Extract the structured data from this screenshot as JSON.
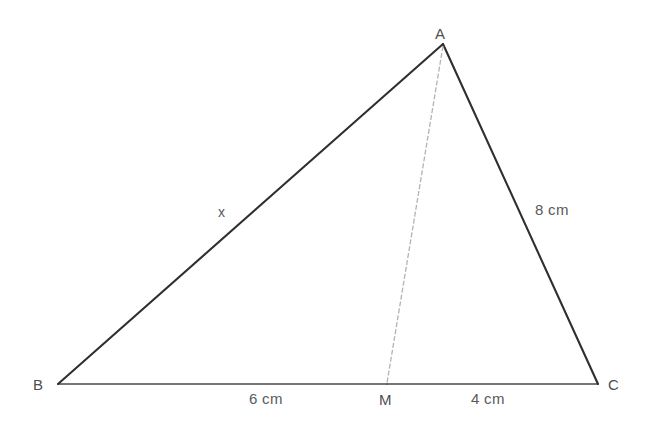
{
  "figure": {
    "kind": "geometry-triangle-with-cevian",
    "background_color": "#ffffff",
    "width": 645,
    "height": 425,
    "stroke_colors": {
      "side_dark": "#2f2f2f",
      "base": "#4a4a4a",
      "cevian": "#b0b0b0",
      "label": "#555555"
    },
    "vertices": {
      "A": {
        "label": "A",
        "x": 443,
        "y": 44
      },
      "B": {
        "label": "B",
        "x": 58,
        "y": 384
      },
      "C": {
        "label": "C",
        "x": 598,
        "y": 384
      },
      "M": {
        "label": "M",
        "x": 387,
        "y": 384
      }
    },
    "segments": [
      {
        "name": "AB",
        "from": "B",
        "to": "A",
        "style": "solid",
        "label": "x"
      },
      {
        "name": "AC",
        "from": "A",
        "to": "C",
        "style": "solid",
        "label": "8 cm"
      },
      {
        "name": "BC",
        "from": "B",
        "to": "C",
        "style": "solid",
        "label": ""
      },
      {
        "name": "BM",
        "from": "B",
        "to": "M",
        "style": "solid",
        "label": "6 cm"
      },
      {
        "name": "MC",
        "from": "M",
        "to": "C",
        "style": "solid",
        "label": "4 cm"
      },
      {
        "name": "AM",
        "from": "A",
        "to": "M",
        "style": "dashed",
        "label": ""
      }
    ],
    "labels": {
      "vertex_a": "A",
      "vertex_b": "B",
      "vertex_c": "C",
      "point_m": "M",
      "side_ab": "x",
      "side_ac": "8 cm",
      "segment_bm": "6 cm",
      "segment_mc": "4 cm"
    }
  }
}
